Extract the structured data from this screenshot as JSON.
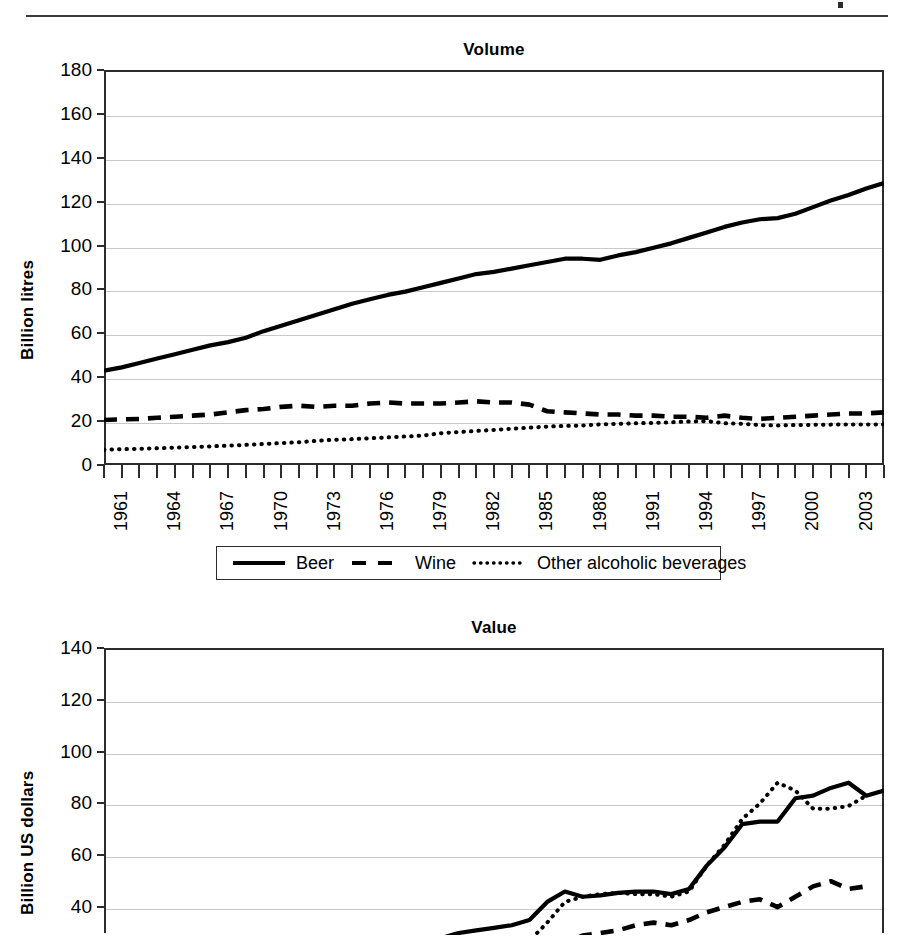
{
  "page": {
    "header_rule": "horizontal-rule",
    "header_mark": "cropped-header-glyph"
  },
  "charts": [
    {
      "id": "volume",
      "title": "Volume",
      "ylabel": "Billion litres"
    },
    {
      "id": "value",
      "title": "Value",
      "ylabel": "Billion US dollars"
    }
  ],
  "legend": {
    "items": [
      {
        "label": "Beer",
        "style": "solid"
      },
      {
        "label": "Wine",
        "style": "dashed"
      },
      {
        "label": "Other alcoholic beverages",
        "style": "dotted"
      }
    ]
  },
  "chart_data": [
    {
      "type": "line",
      "title": "Volume",
      "xlabel": "",
      "ylabel": "Billion litres",
      "ylim": [
        0,
        180
      ],
      "ytick_labels": [
        "0",
        "20",
        "40",
        "60",
        "80",
        "100",
        "120",
        "140",
        "160",
        "180"
      ],
      "ytick_values": [
        0,
        20,
        40,
        60,
        80,
        100,
        120,
        140,
        160,
        180
      ],
      "grid": true,
      "legend_position": "bottom",
      "xlim": [
        1961,
        2005
      ],
      "x": [
        1961,
        1962,
        1963,
        1964,
        1965,
        1966,
        1967,
        1968,
        1969,
        1970,
        1971,
        1972,
        1973,
        1974,
        1975,
        1976,
        1977,
        1978,
        1979,
        1980,
        1981,
        1982,
        1983,
        1984,
        1985,
        1986,
        1987,
        1988,
        1989,
        1990,
        1991,
        1992,
        1993,
        1994,
        1995,
        1996,
        1997,
        1998,
        1999,
        2000,
        2001,
        2002,
        2003,
        2004,
        2005
      ],
      "xtick_labels": [
        "1961",
        "1964",
        "1967",
        "1970",
        "1973",
        "1976",
        "1979",
        "1982",
        "1985",
        "1988",
        "1991",
        "1994",
        "1997",
        "2000",
        "2003"
      ],
      "xtick_label_values": [
        1961,
        1964,
        1967,
        1970,
        1973,
        1976,
        1979,
        1982,
        1985,
        1988,
        1991,
        1994,
        1997,
        2000,
        2003
      ],
      "series": [
        {
          "name": "Beer",
          "style": "solid",
          "values": [
            43,
            44.5,
            46.5,
            48.5,
            50.5,
            52.5,
            54.5,
            56,
            58,
            61,
            63.5,
            66,
            68.5,
            71,
            73.5,
            75.5,
            77.5,
            79,
            81,
            83,
            85,
            87,
            88,
            89.5,
            91,
            92.5,
            94,
            94,
            93.5,
            95.5,
            97,
            99,
            101,
            103.5,
            106,
            108.5,
            110.5,
            112,
            112.5,
            114.5,
            117.5,
            120.5,
            123,
            126,
            128.5
          ]
        },
        {
          "name": "Wine",
          "style": "dashed",
          "values": [
            20.5,
            20.8,
            21,
            21.5,
            22,
            22.5,
            23,
            24,
            25,
            25.5,
            26.5,
            27,
            26.5,
            27,
            27,
            28,
            28.5,
            28,
            28,
            28,
            28.5,
            29,
            28.5,
            28.5,
            27.5,
            24.5,
            24,
            23.5,
            23,
            23,
            22.5,
            22.5,
            22,
            22,
            21.5,
            22.5,
            21.5,
            21,
            21.5,
            22,
            22.5,
            23,
            23.5,
            23.5,
            24
          ]
        },
        {
          "name": "Other alcoholic beverages",
          "style": "dotted",
          "values": [
            7,
            7.2,
            7.4,
            7.6,
            7.9,
            8.2,
            8.5,
            8.8,
            9.2,
            9.6,
            10,
            10.4,
            11,
            11.5,
            11.8,
            12.2,
            12.6,
            13,
            13.4,
            14.5,
            15,
            15.5,
            16,
            16.5,
            17,
            17.5,
            17.8,
            18,
            18.5,
            18.8,
            19,
            19.2,
            19.5,
            19.8,
            20,
            19,
            18.8,
            18.2,
            18,
            18.2,
            18.3,
            18.4,
            18.4,
            18.5,
            18.5
          ]
        }
      ]
    },
    {
      "type": "line",
      "title": "Value",
      "xlabel": "",
      "ylabel": "Billion US dollars",
      "ylim": [
        30,
        140
      ],
      "ytick_labels": [
        "40",
        "60",
        "80",
        "100",
        "120",
        "140"
      ],
      "ytick_values": [
        40,
        60,
        80,
        100,
        120,
        140
      ],
      "grid": true,
      "note": "bottom of chart is cropped by the screenshot edge",
      "xlim": [
        1961,
        2005
      ],
      "x": [
        1961,
        1962,
        1963,
        1964,
        1965,
        1966,
        1967,
        1968,
        1969,
        1970,
        1971,
        1972,
        1973,
        1974,
        1975,
        1976,
        1977,
        1978,
        1979,
        1980,
        1981,
        1982,
        1983,
        1984,
        1985,
        1986,
        1987,
        1988,
        1989,
        1990,
        1991,
        1992,
        1993,
        1994,
        1995,
        1996,
        1997,
        1998,
        1999,
        2000,
        2001,
        2002,
        2003,
        2004,
        2005
      ],
      "series": [
        {
          "name": "Beer",
          "style": "solid",
          "values": [
            4,
            4.5,
            5,
            5.5,
            6,
            6.5,
            7,
            7.5,
            8,
            9,
            10,
            11,
            13,
            15,
            17,
            19,
            21,
            23,
            25,
            28,
            30,
            31,
            32,
            33,
            35,
            42,
            46,
            44,
            44.5,
            45.5,
            46,
            46,
            45,
            47,
            56,
            63,
            72,
            73,
            73,
            82,
            83,
            86,
            88,
            83,
            85
          ]
        },
        {
          "name": "Wine",
          "style": "dashed",
          "values": [
            2,
            2.2,
            2.5,
            2.8,
            3,
            3.3,
            3.6,
            4,
            4.5,
            5,
            5.5,
            6,
            7,
            8,
            9,
            10,
            11,
            12,
            13,
            15,
            16,
            17,
            17.5,
            18,
            19,
            22,
            26,
            29,
            30,
            31,
            33,
            34,
            33,
            35,
            38,
            40,
            42,
            43,
            40,
            44,
            48,
            50,
            47,
            48
          ]
        },
        {
          "name": "Other alcoholic beverages",
          "style": "dotted",
          "values": [
            3,
            3.2,
            3.5,
            3.8,
            4,
            4.4,
            4.8,
            5.2,
            5.6,
            6.2,
            7,
            7.8,
            9,
            10.5,
            12,
            13.5,
            15,
            16.5,
            18,
            20,
            22,
            23,
            24,
            25,
            27,
            34,
            42,
            44,
            45,
            45.5,
            45,
            45,
            44,
            46,
            56,
            64,
            74,
            80,
            88,
            85,
            78,
            78,
            79,
            83
          ]
        }
      ]
    }
  ]
}
